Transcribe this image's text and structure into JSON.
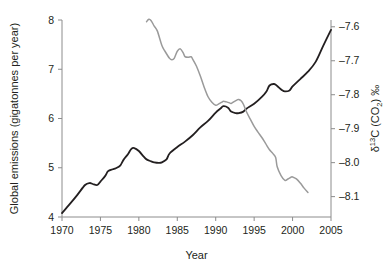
{
  "chart_data": {
    "type": "line",
    "title": "",
    "xlabel": "Year",
    "ylabel_left": "Global emissions (gigatonnes per year)",
    "ylabel_right": "δ¹³C (CO₂) ‰",
    "ylabel_right_parts": {
      "delta": "δ",
      "superscript": "13",
      "c": "C (CO",
      "subscript": "2",
      "close": ") ‰"
    },
    "grid": false,
    "legend": "none",
    "xlim": [
      1970,
      2005
    ],
    "xticks": [
      1970,
      1975,
      1980,
      1985,
      1990,
      1995,
      2000,
      2005
    ],
    "xtick_labels": [
      "1970",
      "1975",
      "1980",
      "1985",
      "1990",
      "1995",
      "2000",
      "2005"
    ],
    "ylim_left": [
      4,
      8
    ],
    "yticks_left": [
      4,
      5,
      6,
      7,
      8
    ],
    "ytick_labels_left": [
      "4",
      "5",
      "6",
      "7",
      "8"
    ],
    "ylim_right": [
      -8.16,
      -7.58
    ],
    "yticks_right": [
      -7.6,
      -7.7,
      -7.8,
      -7.9,
      -8.0,
      -8.1
    ],
    "ytick_labels_right": [
      "–7.6",
      "–7.7",
      "–7.8",
      "–7.9",
      "–8.0",
      "–8.1"
    ],
    "colors": {
      "emissions": "#231f20",
      "isotope": "#9a9a9a",
      "axis": "#8c8c8c",
      "background": "#ffffff"
    },
    "series": [
      {
        "name": "Global emissions (gigatonnes per year)",
        "axis": "left",
        "color": "#231f20",
        "x": [
          1970,
          1971,
          1972,
          1973,
          1973.6,
          1974,
          1974.6,
          1975,
          1975.6,
          1976,
          1976.6,
          1977,
          1977.6,
          1978,
          1978.6,
          1979,
          1979.4,
          1980,
          1980.6,
          1981,
          1981.6,
          1982,
          1982.6,
          1983,
          1983.6,
          1984,
          1985,
          1986,
          1987,
          1988,
          1989,
          1990,
          1990.6,
          1991,
          1991.6,
          1992,
          1992.6,
          1993,
          1993.6,
          1994,
          1995,
          1996,
          1996.6,
          1997,
          1997.6,
          1998,
          1998.6,
          1999,
          1999.6,
          2000,
          2001,
          2002,
          2003,
          2004,
          2005
        ],
        "y": [
          4.08,
          4.26,
          4.45,
          4.65,
          4.69,
          4.67,
          4.65,
          4.72,
          4.83,
          4.93,
          4.97,
          4.99,
          5.05,
          5.16,
          5.28,
          5.38,
          5.4,
          5.34,
          5.23,
          5.17,
          5.13,
          5.11,
          5.1,
          5.11,
          5.17,
          5.29,
          5.42,
          5.53,
          5.66,
          5.82,
          5.95,
          6.12,
          6.2,
          6.25,
          6.22,
          6.14,
          6.11,
          6.11,
          6.14,
          6.2,
          6.3,
          6.44,
          6.55,
          6.67,
          6.7,
          6.66,
          6.58,
          6.55,
          6.57,
          6.65,
          6.8,
          6.95,
          7.15,
          7.48,
          7.8
        ]
      },
      {
        "name": "δ¹³C (CO₂) ‰",
        "axis": "right",
        "color": "#9a9a9a",
        "x": [
          1981,
          1981.3,
          1981.6,
          1982,
          1982.4,
          1983,
          1983.4,
          1984,
          1984.3,
          1984.6,
          1985,
          1985.4,
          1985.8,
          1986,
          1986.4,
          1986.8,
          1987,
          1987.5,
          1988,
          1988.5,
          1989,
          1989.5,
          1990,
          1990.4,
          1990.8,
          1991,
          1991.4,
          1991.8,
          1992,
          1992.4,
          1992.8,
          1993,
          1993.3,
          1993.6,
          1994,
          1994.5,
          1995,
          1995.5,
          1996,
          1996.5,
          1997,
          1997.4,
          1997.8,
          1998,
          1998.5,
          1999,
          1999.4,
          1999.8,
          2000,
          2000.5,
          2001,
          2001.5,
          2002
        ],
        "y": [
          -7.585,
          -7.578,
          -7.582,
          -7.598,
          -7.612,
          -7.655,
          -7.672,
          -7.693,
          -7.697,
          -7.693,
          -7.672,
          -7.665,
          -7.678,
          -7.688,
          -7.69,
          -7.688,
          -7.695,
          -7.716,
          -7.745,
          -7.778,
          -7.806,
          -7.822,
          -7.831,
          -7.827,
          -7.822,
          -7.819,
          -7.821,
          -7.824,
          -7.826,
          -7.82,
          -7.815,
          -7.814,
          -7.818,
          -7.828,
          -7.85,
          -7.872,
          -7.893,
          -7.91,
          -7.926,
          -7.944,
          -7.962,
          -7.972,
          -7.985,
          -8.012,
          -8.038,
          -8.052,
          -8.048,
          -8.043,
          -8.042,
          -8.048,
          -8.06,
          -8.075,
          -8.088
        ]
      }
    ]
  }
}
